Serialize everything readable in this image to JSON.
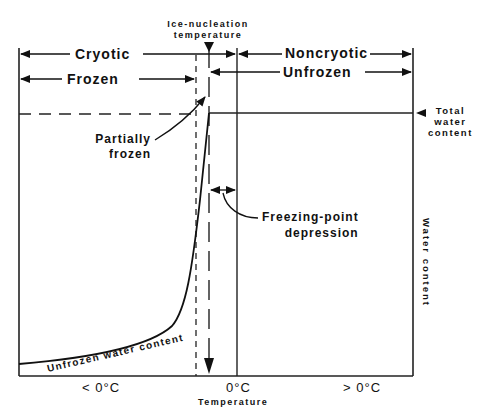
{
  "diagram": {
    "title_annotation": "Ice-nucleation temperature",
    "annotation_line1": "Ice-nucleation",
    "annotation_line2": "temperature",
    "regions": {
      "cryotic": "Cryotic",
      "noncryotic": "Noncryotic",
      "frozen": "Frozen",
      "unfrozen": "Unfrozen"
    },
    "labels": {
      "partially_frozen_line1": "Partially",
      "partially_frozen_line2": "frozen",
      "freezing_point_line1": "Freezing-point",
      "freezing_point_line2": "depression",
      "total_water_line1": "Total",
      "total_water_line2": "water",
      "total_water_line3": "content",
      "unfrozen_water_content": "Unfrozen water content"
    },
    "axes": {
      "x_label": "Temperature",
      "y_label": "Water content",
      "x_ticks": [
        "< 0°C",
        "0°C",
        "> 0°C"
      ]
    }
  }
}
